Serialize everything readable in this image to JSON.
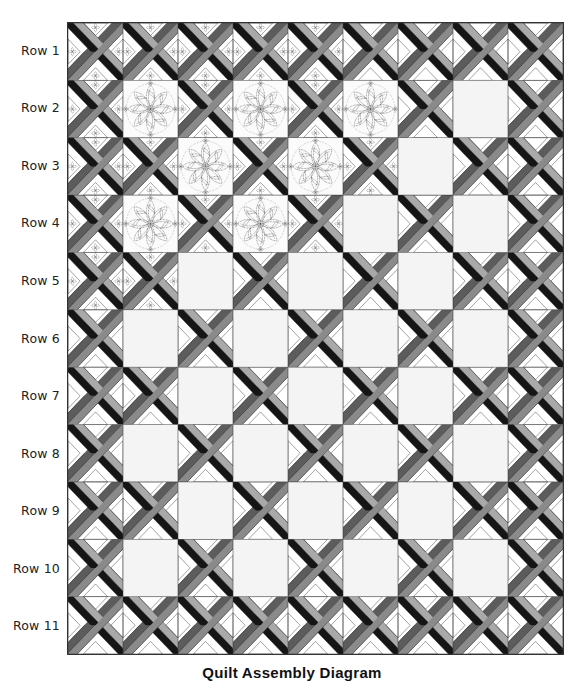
{
  "diagram": {
    "caption": "Quilt Assembly Diagram",
    "rows": 11,
    "columns": 9,
    "row_labels": [
      "Row 1",
      "Row 2",
      "Row 3",
      "Row 4",
      "Row 5",
      "Row 6",
      "Row 7",
      "Row 8",
      "Row 9",
      "Row 10",
      "Row 11"
    ],
    "block_legend": {
      "L": "lattice-block",
      "Q": "quilted-feather-square",
      "P": "plain-square"
    },
    "layout": [
      [
        "L",
        "L",
        "L",
        "L",
        "L",
        "L",
        "L",
        "L",
        "L"
      ],
      [
        "L",
        "Q",
        "L",
        "Q",
        "L",
        "Q",
        "L",
        "P",
        "L"
      ],
      [
        "L",
        "L",
        "Q",
        "L",
        "Q",
        "L",
        "P",
        "L",
        "L"
      ],
      [
        "L",
        "Q",
        "L",
        "Q",
        "L",
        "P",
        "L",
        "P",
        "L"
      ],
      [
        "L",
        "L",
        "P",
        "L",
        "P",
        "L",
        "P",
        "L",
        "L"
      ],
      [
        "L",
        "P",
        "L",
        "P",
        "L",
        "P",
        "L",
        "P",
        "L"
      ],
      [
        "L",
        "L",
        "P",
        "L",
        "P",
        "L",
        "P",
        "L",
        "L"
      ],
      [
        "L",
        "P",
        "L",
        "P",
        "L",
        "P",
        "L",
        "P",
        "L"
      ],
      [
        "L",
        "L",
        "P",
        "L",
        "P",
        "L",
        "P",
        "L",
        "L"
      ],
      [
        "L",
        "P",
        "L",
        "P",
        "L",
        "P",
        "L",
        "P",
        "L"
      ],
      [
        "L",
        "L",
        "L",
        "L",
        "L",
        "L",
        "L",
        "L",
        "L"
      ]
    ],
    "motif_cells": [
      [
        0,
        0
      ],
      [
        0,
        1
      ],
      [
        0,
        2
      ],
      [
        0,
        3
      ],
      [
        0,
        4
      ],
      [
        1,
        0
      ],
      [
        1,
        2
      ],
      [
        1,
        4
      ],
      [
        2,
        0
      ],
      [
        2,
        1
      ],
      [
        2,
        3
      ],
      [
        2,
        5
      ],
      [
        3,
        0
      ],
      [
        3,
        2
      ],
      [
        3,
        4
      ],
      [
        4,
        0
      ],
      [
        4,
        1
      ]
    ],
    "colors": {
      "outline": "#333333",
      "black_band": "#151515",
      "light_band": "#a9a9a9",
      "medium_band": "#8a8a8a",
      "dark_band": "#5c5c5c",
      "triangle": "#ffffff",
      "plain_square": "#f4f4f4",
      "quilt_stitch": "#555555"
    }
  }
}
